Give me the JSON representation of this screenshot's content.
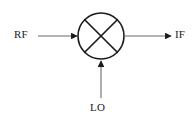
{
  "diagram": {
    "type": "schematic-symbol",
    "background_color": "#ffffff",
    "line_color": "#1a1a1a",
    "symbol": {
      "name": "mixer",
      "shape": "circle-with-x",
      "center": {
        "x": 101,
        "y": 36
      },
      "radius": 23
    },
    "ports": [
      {
        "id": "rf",
        "label": "RF",
        "direction": "input",
        "side": "left",
        "arrow": "right",
        "line": {
          "x1": 38,
          "y1": 36,
          "x2": 78,
          "y2": 36
        }
      },
      {
        "id": "lo",
        "label": "LO",
        "direction": "input",
        "side": "bottom",
        "arrow": "up",
        "line": {
          "x1": 101,
          "y1": 98,
          "x2": 101,
          "y2": 60
        }
      },
      {
        "id": "if",
        "label": "IF",
        "direction": "output",
        "side": "right",
        "arrow": "right",
        "line": {
          "x1": 124,
          "y1": 36,
          "x2": 172,
          "y2": 36
        }
      }
    ]
  }
}
